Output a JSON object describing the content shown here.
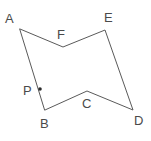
{
  "figure": {
    "type": "geometry-diagram",
    "canvas": {
      "width": 151,
      "height": 141,
      "background": "#ffffff"
    },
    "stroke_color": "#5a5a5a",
    "label_color": "#4a4a4a",
    "point_color": "#2b2b2b",
    "stroke_width": 1,
    "polygon_order": [
      "A",
      "F",
      "E",
      "D",
      "C",
      "B"
    ],
    "polygon_path": "M20,29 L63,47 L105,30 L133,110 L87,91 L45,110 Z",
    "vertices": [
      {
        "id": "A",
        "label": "A",
        "x": 20,
        "y": 29,
        "label_x": 5,
        "label_y": 12
      },
      {
        "id": "F",
        "label": "F",
        "x": 63,
        "y": 47,
        "label_x": 57,
        "label_y": 28
      },
      {
        "id": "E",
        "label": "E",
        "x": 105,
        "y": 30,
        "label_x": 104,
        "label_y": 11
      },
      {
        "id": "D",
        "label": "D",
        "x": 133,
        "y": 110,
        "label_x": 134,
        "label_y": 114
      },
      {
        "id": "C",
        "label": "C",
        "x": 87,
        "y": 91,
        "label_x": 82,
        "label_y": 97
      },
      {
        "id": "B",
        "label": "B",
        "x": 45,
        "y": 110,
        "label_x": 40,
        "label_y": 117
      }
    ],
    "marked_points": [
      {
        "id": "P",
        "label": "P",
        "x": 40,
        "y": 89,
        "label_x": 23,
        "label_y": 84,
        "on_segment": "AB",
        "radius": 1.8
      }
    ],
    "edges": [
      {
        "from": "A",
        "to": "F"
      },
      {
        "from": "F",
        "to": "E"
      },
      {
        "from": "E",
        "to": "D"
      },
      {
        "from": "D",
        "to": "C"
      },
      {
        "from": "C",
        "to": "B"
      },
      {
        "from": "B",
        "to": "A"
      }
    ]
  }
}
